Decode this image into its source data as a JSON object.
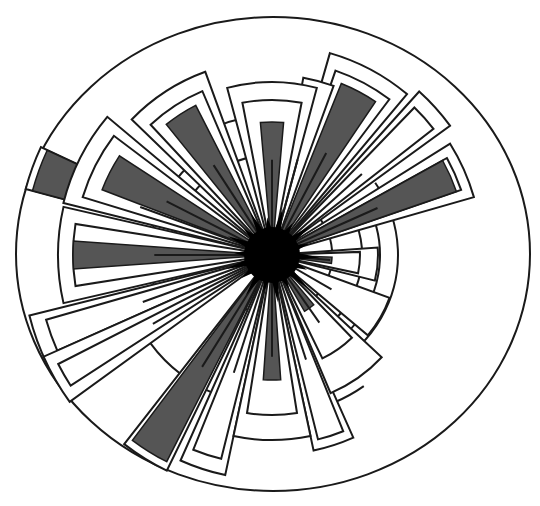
{
  "diagram": {
    "type": "radial-rose",
    "center": [
      272,
      255
    ],
    "outer_ellipse": {
      "rx": 257,
      "ry": 237,
      "stroke": "#1a1a1a"
    },
    "colors": {
      "bar": "#555555",
      "line": "#1a1a1a",
      "core": "#000000",
      "background": "#ffffff"
    },
    "rings": [
      {
        "r": 60,
        "from": -40,
        "to": 120
      },
      {
        "r": 90,
        "from": -20,
        "to": 110
      },
      {
        "r": 108,
        "from": -30,
        "to": 100
      },
      {
        "r": 126,
        "from": -35,
        "to": 95
      },
      {
        "r": 100,
        "from": 170,
        "to": 310
      },
      {
        "r": 122,
        "from": 160,
        "to": 250
      },
      {
        "r": 140,
        "from": 240,
        "to": 300
      },
      {
        "r": 170,
        "from": 255,
        "to": 285
      },
      {
        "r": 150,
        "from": 95,
        "to": 160
      },
      {
        "r": 160,
        "from": 55,
        "to": 80
      }
    ],
    "petals": [
      {
        "angle": 270,
        "frames": [
          [
            173,
            15
          ],
          [
            155,
            11
          ]
        ],
        "bar": [
          133,
          5
        ]
      },
      {
        "angle": 237,
        "frames": [
          [
            195,
            13
          ],
          [
            178,
            10
          ]
        ],
        "bar": [
          168,
          6
        ]
      },
      {
        "angle": 207,
        "frames": [
          [
            215,
            13
          ],
          [
            198,
            10
          ]
        ],
        "bar": [
          182,
          6
        ]
      },
      {
        "angle": 180,
        "frames": [
          [
            214,
            13
          ],
          [
            199,
            9
          ]
        ],
        "bar": [
          199,
          4
        ]
      },
      {
        "angle": 160,
        "frames": [
          [
            250,
            6
          ],
          [
            235,
            4
          ]
        ],
        "bar": null
      },
      {
        "angle": 200,
        "frames": [
          [
            255,
            5
          ]
        ],
        "bar": [
          248,
          5
        ]
      },
      {
        "angle": 150,
        "frames": [
          [
            250,
            6
          ],
          [
            240,
            3
          ]
        ],
        "bar": null
      },
      {
        "angle": 122,
        "frames": [
          [
            240,
            6
          ],
          [
            225,
            4
          ]
        ],
        "bar": [
          232,
          5
        ]
      },
      {
        "angle": 108,
        "frames": [
          [
            225,
            6
          ],
          [
            210,
            4
          ]
        ],
        "bar": null
      },
      {
        "angle": 90,
        "frames": [
          [
            185,
            12
          ],
          [
            160,
            9
          ]
        ],
        "bar": [
          125,
          4
        ]
      },
      {
        "angle": 72,
        "frames": [
          [
            200,
            6
          ],
          [
            190,
            4
          ]
        ],
        "bar": null
      },
      {
        "angle": 55,
        "frames": [
          [
            150,
            12
          ],
          [
            115,
            9
          ]
        ],
        "bar": [
          65,
          5
        ]
      },
      {
        "angle": 30,
        "frames": [
          [
            125,
            10
          ]
        ],
        "bar": null
      },
      {
        "angle": 5,
        "frames": [
          [
            106,
            9
          ],
          [
            88,
            7
          ]
        ],
        "bar": [
          60,
          3
        ]
      },
      {
        "angle": 336,
        "frames": [
          [
            210,
            8
          ],
          [
            200,
            5
          ]
        ],
        "bar": [
          195,
          5
        ]
      },
      {
        "angle": 318,
        "frames": [
          [
            220,
            6
          ],
          [
            205,
            4
          ]
        ],
        "bar": null
      },
      {
        "angle": 298,
        "frames": [
          [
            210,
            12
          ],
          [
            195,
            9
          ]
        ],
        "bar": [
          185,
          6
        ]
      },
      {
        "angle": 285,
        "frames": [
          [
            180,
            5
          ]
        ],
        "bar": null
      }
    ],
    "core": {
      "r_inner": 22,
      "r_outer": 48,
      "spikes": 18
    }
  }
}
